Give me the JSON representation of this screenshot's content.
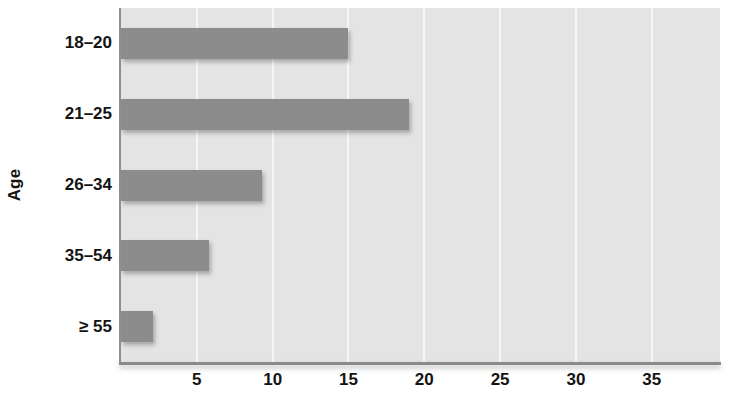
{
  "chart_data": {
    "type": "bar",
    "orientation": "horizontal",
    "title": "",
    "subtitle": "",
    "xlabel": "",
    "ylabel": "Age",
    "categories": [
      "18–20",
      "21–25",
      "26–34",
      "35–54",
      "≥ 55"
    ],
    "values": [
      15.0,
      19.0,
      9.3,
      5.8,
      2.1
    ],
    "series": [
      {
        "name": "",
        "values": [
          15.0,
          19.0,
          9.3,
          5.8,
          2.1
        ]
      }
    ],
    "xlim": [
      0,
      39.5
    ],
    "ylim": [
      0,
      5
    ],
    "x_ticks": [
      5,
      10,
      15,
      20,
      25,
      30,
      35
    ],
    "x_tick_labels": [
      "5",
      "10",
      "15",
      "20",
      "25",
      "30",
      "35"
    ],
    "grid": "vertical",
    "legend": "none",
    "annotations": [],
    "colors": {
      "bar": "#8c8c8c",
      "plot_background": "#e4e4e4",
      "gridline": "#f7f7f7",
      "axis": "#8a8a8a",
      "text": "#141414",
      "page_background": "#ffffff"
    }
  },
  "axis": {
    "y_title": "Age",
    "x_ticks": [
      "5",
      "10",
      "15",
      "20",
      "25",
      "30",
      "35"
    ],
    "category_labels": [
      "18–20",
      "21–25",
      "26–34",
      "35–54",
      "≥ 55"
    ]
  }
}
